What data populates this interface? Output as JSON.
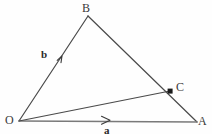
{
  "figure": {
    "kind": "vector-triangle-diagram",
    "background_color": "#fefefe",
    "stroke_color": "#4a4a4a",
    "label_color": "#3a3a3a",
    "width": 212,
    "height": 134
  },
  "vertices": [
    {
      "id": "O",
      "label": "O",
      "x": 19,
      "y": 121
    },
    {
      "id": "B",
      "label": "B",
      "x": 88,
      "y": 16
    },
    {
      "id": "A",
      "label": "A",
      "x": 197,
      "y": 122
    },
    {
      "id": "C",
      "label": "C",
      "x": 170,
      "y": 91
    }
  ],
  "point_markers": [
    {
      "id": "C",
      "x": 170,
      "y": 91,
      "shape": "filled-square",
      "size": 5,
      "color": "#1a1a1a"
    }
  ],
  "segments": [
    {
      "id": "OB",
      "from": "O",
      "to": "B",
      "label": "b",
      "arrow": true,
      "arrow_at": {
        "x": 62,
        "y": 56
      }
    },
    {
      "id": "BA",
      "from": "B",
      "to": "A",
      "label": "",
      "arrow": false,
      "arrow_at": null
    },
    {
      "id": "OA",
      "from": "O",
      "to": "A",
      "label": "a",
      "arrow": true,
      "arrow_at": {
        "x": 108,
        "y": 120
      }
    },
    {
      "id": "OC",
      "from": "O",
      "to": "C",
      "label": "",
      "arrow": false,
      "arrow_at": null
    }
  ],
  "vector_labels": [
    {
      "id": "b",
      "text": "b",
      "bold": true,
      "x": 45,
      "y": 55
    },
    {
      "id": "a",
      "text": "a",
      "bold": true,
      "x": 107,
      "y": 130
    }
  ],
  "labels": {
    "B": "B",
    "O": "O",
    "A": "A",
    "C": "C",
    "vector_a": "a",
    "vector_b": "b"
  }
}
